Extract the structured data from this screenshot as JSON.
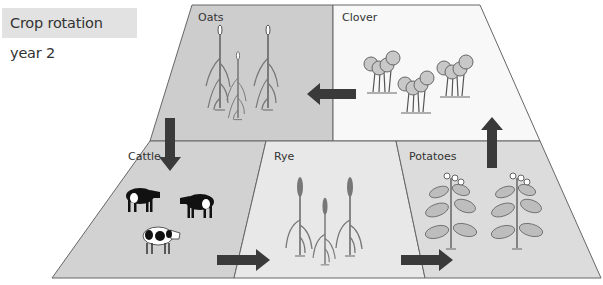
{
  "title": "Crop rotation year 2",
  "colors": {
    "oats": "#cdcdcd",
    "clover": "#f8f8f8",
    "cattle": "#d2d2d2",
    "rye": "#e8e8e8",
    "potatoes": "#dcdcdc",
    "arrow": "#3a3a3a",
    "outline": "#555555"
  },
  "fields": [
    {
      "id": "oats",
      "label": "Oats",
      "icon": "oat-plant-icon",
      "count": 3
    },
    {
      "id": "clover",
      "label": "Clover",
      "icon": "clover-plant-icon",
      "count": 3
    },
    {
      "id": "cattle",
      "label": "Cattle",
      "icon": "cow-icon",
      "count": 3
    },
    {
      "id": "rye",
      "label": "Rye",
      "icon": "rye-plant-icon",
      "count": 3
    },
    {
      "id": "potatoes",
      "label": "Potatoes",
      "icon": "potato-plant-icon",
      "count": 2
    }
  ],
  "rotation_flow": [
    {
      "from": "Oats",
      "to": "Cattle",
      "direction": "down"
    },
    {
      "from": "Cattle",
      "to": "Rye",
      "direction": "right"
    },
    {
      "from": "Rye",
      "to": "Potatoes",
      "direction": "right"
    },
    {
      "from": "Potatoes",
      "to": "Clover",
      "direction": "up"
    },
    {
      "from": "Clover",
      "to": "Oats",
      "direction": "left"
    }
  ]
}
